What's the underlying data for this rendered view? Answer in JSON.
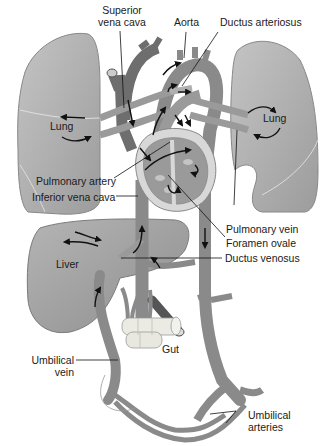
{
  "diagram": {
    "type": "anatomical-illustration",
    "colors": {
      "organ_fill": "#a9a9a9",
      "organ_light": "#bdbdbd",
      "vessel_dark": "#6e6e6e",
      "vessel_mid": "#8a8a8a",
      "heart_wall": "#d8d8d8",
      "arrow": "#111111",
      "label_text": "#1a1a1a",
      "background": "#ffffff"
    },
    "labels": {
      "superior_vena_cava_1": "Superior",
      "superior_vena_cava_2": "vena cava",
      "aorta": "Aorta",
      "ductus_arteriosus": "Ductus arteriosus",
      "lung_left": "Lung",
      "lung_right": "Lung",
      "pulmonary_artery": "Pulmonary artery",
      "inferior_vena_cava": "Inferior vena cava",
      "pulmonary_vein": "Pulmonary vein",
      "foramen_ovale": "Foramen ovale",
      "liver": "Liver",
      "ductus_venosus": "Ductus venosus",
      "gut": "Gut",
      "umbilical_vein_1": "Umbilical",
      "umbilical_vein_2": "vein",
      "umbilical_arteries_1": "Umbilical",
      "umbilical_arteries_2": "arteries"
    }
  }
}
